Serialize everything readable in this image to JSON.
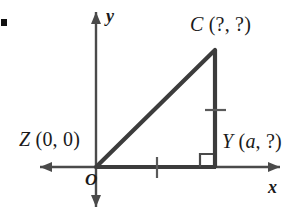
{
  "figure": {
    "type": "coordinate-geometry-diagram",
    "background_color": "#ffffff",
    "stroke_color": "#3c3c3c",
    "axis_color": "#4a4a4a",
    "text_color": "#1a1a1a",
    "axes": {
      "x_axis_label": "x",
      "y_axis_label": "y",
      "origin_label": "O",
      "x_axis": {
        "x1": 40,
        "x2": 280,
        "y": 167,
        "arrow_start": true,
        "arrow_end": true
      },
      "y_axis": {
        "y1": 12,
        "y2": 207,
        "x": 96,
        "arrow_start": true,
        "arrow_end": true
      }
    },
    "vertices": [
      {
        "id": "Z",
        "name": "Z",
        "coords": "(0, 0)",
        "label_text": "Z (0, 0)",
        "x": 96,
        "y": 167,
        "has_variable": false
      },
      {
        "id": "C",
        "name": "C",
        "coords": "(?, ?)",
        "label_text": "C (?, ?)",
        "x": 215,
        "y": 50,
        "has_variable": false
      },
      {
        "id": "Y",
        "name": "Y",
        "coords": "(a, ?)",
        "coords_prefix": "(",
        "coords_variable": "a",
        "coords_suffix": ", ?)",
        "label_text": "Y (a, ?)",
        "x": 215,
        "y": 167,
        "has_variable": true
      }
    ],
    "triangle": {
      "points": "96,167 215,167 215,50",
      "sides": [
        {
          "from": "Z",
          "to": "Y",
          "kind": "horizontal-leg",
          "tick_marks": 1
        },
        {
          "from": "Y",
          "to": "C",
          "kind": "vertical-leg",
          "tick_marks": 1
        },
        {
          "from": "Z",
          "to": "C",
          "kind": "hypotenuse",
          "tick_marks": 0
        }
      ]
    },
    "markers": {
      "right_angle": {
        "at": "Y",
        "size": 13,
        "note": "square marker indicating 90 degrees"
      },
      "tick_horizontal_leg": {
        "x": 157,
        "y": 167,
        "orientation": "vertical-stroke"
      },
      "tick_vertical_leg": {
        "x": 215,
        "y": 110,
        "orientation": "horizontal-stroke"
      }
    }
  }
}
